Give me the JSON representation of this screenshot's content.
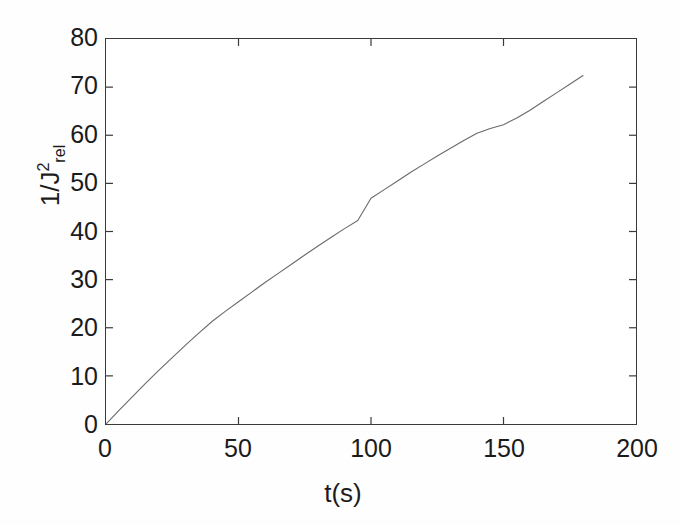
{
  "figure": {
    "background_color": "#ffffff",
    "axis_color": "#3a3a3a",
    "line_color": "#6a6a6a"
  },
  "chart_data": {
    "type": "line",
    "title": "",
    "subtitle": "",
    "xlabel": "t(s)",
    "ylabel_parts": {
      "prefix": "1/J",
      "exponent": "2",
      "subscript": "rel"
    },
    "ylabel_plain": "1/J2rel",
    "xlim": [
      0,
      200
    ],
    "ylim": [
      0,
      80
    ],
    "xticks": [
      0,
      50,
      100,
      150,
      200
    ],
    "xtick_labels": [
      "0",
      "50",
      "100",
      "150",
      "200"
    ],
    "yticks": [
      0,
      10,
      20,
      30,
      40,
      50,
      60,
      70,
      80
    ],
    "ytick_labels": [
      "0",
      "10",
      "20",
      "30",
      "40",
      "50",
      "60",
      "70",
      "80"
    ],
    "grid": false,
    "legend": null,
    "tick_direction": "in",
    "series": [
      {
        "name": "1/J2rel vs t",
        "color": "#6a6a6a",
        "line_width": 1.1,
        "marker": "none",
        "x": [
          0,
          5,
          10,
          15,
          20,
          25,
          30,
          35,
          40,
          45,
          50,
          55,
          60,
          65,
          70,
          75,
          80,
          85,
          90,
          95,
          100,
          105,
          110,
          115,
          120,
          125,
          130,
          135,
          140,
          145,
          150,
          155,
          160,
          165,
          170,
          175,
          180
        ],
        "y": [
          0.0,
          2.9,
          5.7,
          8.5,
          11.2,
          13.8,
          16.4,
          18.9,
          21.3,
          23.4,
          25.4,
          27.4,
          29.4,
          31.3,
          33.2,
          35.1,
          37.0,
          38.8,
          40.6,
          42.3,
          46.9,
          48.7,
          50.5,
          52.3,
          54.0,
          55.7,
          57.3,
          58.9,
          60.4,
          61.4,
          62.2,
          63.6,
          65.2,
          67.0,
          68.8,
          70.6,
          72.4
        ]
      }
    ]
  }
}
